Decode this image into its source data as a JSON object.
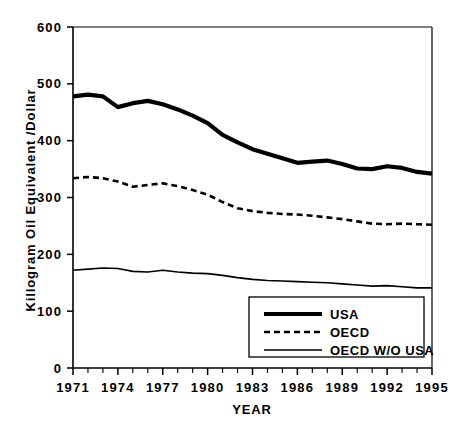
{
  "chart_data": {
    "type": "line",
    "title": "",
    "xlabel": "YEAR",
    "ylabel": "Killogram Oil Equivalent /Dollar",
    "xlim": [
      1971,
      1995
    ],
    "ylim": [
      0,
      600
    ],
    "ytick_labels": [
      "600",
      "500",
      "400",
      "300",
      "200",
      "100",
      "0"
    ],
    "ytick_values": [
      600,
      500,
      400,
      300,
      200,
      100,
      0
    ],
    "xtick_labels": [
      "1971",
      "1974",
      "1977",
      "1980",
      "1983",
      "1986",
      "1989",
      "1992",
      "1995"
    ],
    "xtick_values": [
      1971,
      1974,
      1977,
      1980,
      1983,
      1986,
      1989,
      1992,
      1995
    ],
    "x": [
      1971,
      1972,
      1973,
      1974,
      1975,
      1976,
      1977,
      1978,
      1979,
      1980,
      1981,
      1982,
      1983,
      1984,
      1985,
      1986,
      1987,
      1988,
      1989,
      1990,
      1991,
      1992,
      1993,
      1994,
      1995
    ],
    "grid": false,
    "legend_position": "lower-right",
    "series": [
      {
        "name": "USA",
        "style": "solid-thick",
        "color": "#000000",
        "values": [
          478,
          481,
          478,
          459,
          466,
          470,
          464,
          455,
          444,
          431,
          410,
          397,
          385,
          377,
          369,
          361,
          363,
          365,
          359,
          351,
          350,
          355,
          352,
          345,
          342
        ]
      },
      {
        "name": "OECD",
        "style": "dashed",
        "color": "#000000",
        "values": [
          334,
          336,
          334,
          328,
          319,
          322,
          325,
          320,
          313,
          305,
          292,
          281,
          276,
          273,
          271,
          270,
          268,
          265,
          262,
          258,
          254,
          253,
          254,
          253,
          252
        ]
      },
      {
        "name": "OECD W/O USA",
        "style": "solid-thin",
        "color": "#000000",
        "values": [
          172,
          174,
          176,
          175,
          170,
          169,
          172,
          169,
          167,
          166,
          163,
          159,
          156,
          154,
          153,
          152,
          151,
          150,
          148,
          146,
          144,
          145,
          143,
          141,
          141
        ]
      }
    ],
    "legend": [
      {
        "label": "USA",
        "style": "solid-thick"
      },
      {
        "label": "OECD",
        "style": "dashed"
      },
      {
        "label": "OECD W/O USA",
        "style": "solid-thin"
      }
    ]
  },
  "axes": {
    "y_title": "Killogram Oil Equivalent /Dollar",
    "x_title": "YEAR"
  }
}
